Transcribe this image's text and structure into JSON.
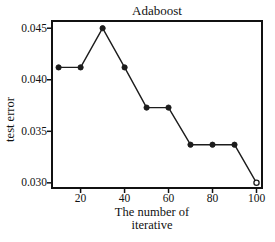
{
  "chart_data": {
    "type": "line",
    "title": "Adaboost",
    "ylabel": "test error",
    "xlabel": "The number of iterative",
    "xlabel_lines": [
      "The number of",
      "iterative"
    ],
    "x": [
      10,
      20,
      30,
      40,
      50,
      60,
      70,
      80,
      90,
      100
    ],
    "y": [
      0.0412,
      0.0412,
      0.045,
      0.0412,
      0.0373,
      0.0373,
      0.0337,
      0.0337,
      0.0337,
      0.03
    ],
    "xticks": [
      20,
      40,
      60,
      80,
      100
    ],
    "xtick_labels": [
      "20",
      "40",
      "60",
      "80",
      "100"
    ],
    "yticks": [
      0.045,
      0.04,
      0.035,
      0.03
    ],
    "ytick_labels": [
      "0.045",
      "0.040",
      "0.035",
      "0.030"
    ],
    "xlim": [
      7,
      102.5
    ],
    "ylim": [
      0.0295,
      0.0457
    ],
    "grid": false,
    "legend": "none",
    "frame": "box",
    "line_color": "#1c1c1c",
    "marker_color": "#1c1c1c",
    "axis_color": "#111111",
    "background": "#ffffff",
    "marker": "circle",
    "last_marker_style": "open"
  }
}
